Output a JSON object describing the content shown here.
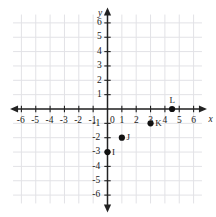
{
  "chart_data": {
    "type": "scatter",
    "title": "",
    "xlabel": "x",
    "ylabel": "y",
    "xlim": [
      -7,
      7
    ],
    "ylim": [
      -7,
      7
    ],
    "grid": true,
    "grid_step": 1,
    "legend": "none",
    "x_tick_labels": [
      "-6",
      "-5",
      "-4",
      "-3",
      "-2",
      "-1",
      "1",
      "2",
      "3",
      "4",
      "5",
      "6"
    ],
    "x_tick_values": [
      -6,
      -5,
      -4,
      -3,
      -2,
      -1,
      1,
      2,
      3,
      4,
      5,
      6
    ],
    "y_tick_labels": [
      "6",
      "5",
      "4",
      "3",
      "2",
      "1",
      "-1",
      "-2",
      "-3",
      "-4",
      "-5",
      "-6"
    ],
    "y_tick_values": [
      6,
      5,
      4,
      3,
      2,
      1,
      -1,
      -2,
      -3,
      -4,
      -5,
      -6
    ],
    "origin_label": "0",
    "points": [
      {
        "label": "I",
        "x": 0,
        "y": -3,
        "label_pos": "right"
      },
      {
        "label": "J",
        "x": 1,
        "y": -2,
        "label_pos": "right"
      },
      {
        "label": "K",
        "x": 3,
        "y": -1,
        "label_pos": "right"
      },
      {
        "label": "L",
        "x": 4.5,
        "y": 0,
        "label_pos": "above"
      }
    ],
    "colors": {
      "point": "#111111",
      "axis": "#222222",
      "grid": "#e2e2e6",
      "background": "#ffffff",
      "text": "#1a1a1a"
    }
  }
}
